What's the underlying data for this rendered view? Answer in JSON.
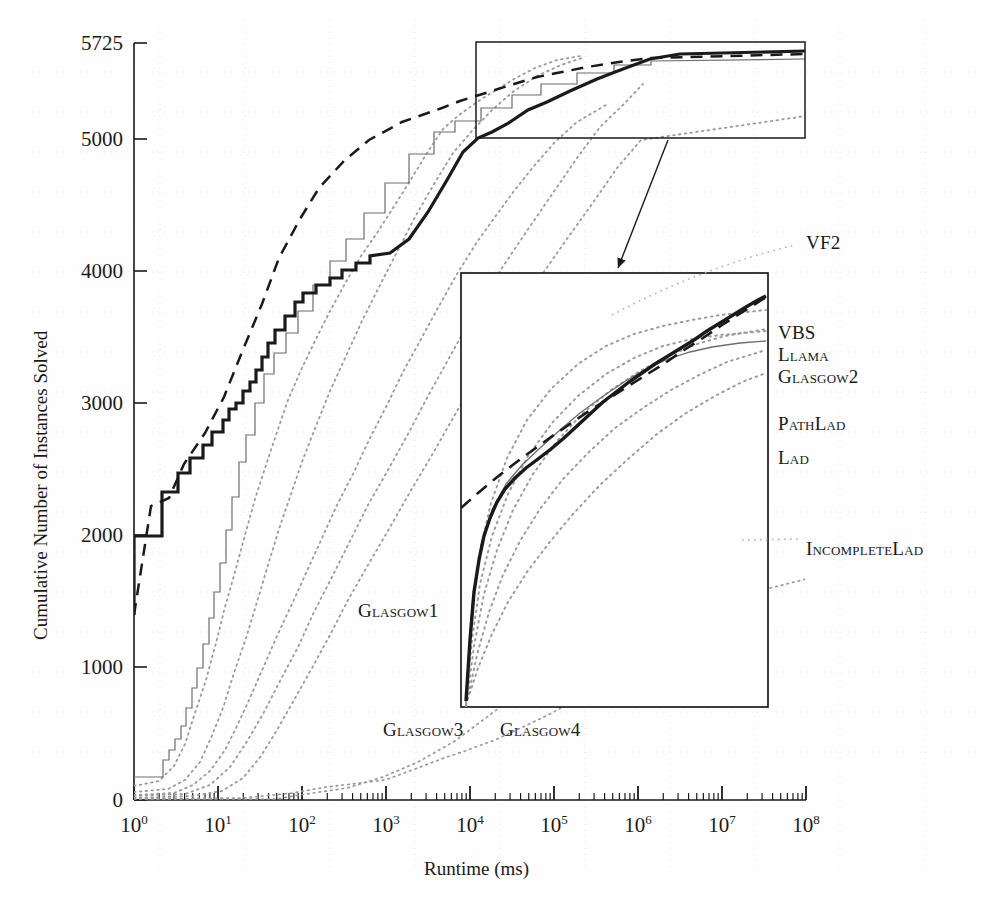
{
  "figure": {
    "background": "#fefefe",
    "ink": "#1a1a1a",
    "faint": "#c8c8c8"
  },
  "axes": {
    "x_title": "Runtime (ms)",
    "y_title": "Cumulative Number of Instances Solved",
    "x_ticks": [
      {
        "mantissa": "10",
        "exp": "0",
        "value": 1
      },
      {
        "mantissa": "10",
        "exp": "1",
        "value": 10
      },
      {
        "mantissa": "10",
        "exp": "2",
        "value": 100
      },
      {
        "mantissa": "10",
        "exp": "3",
        "value": 1000
      },
      {
        "mantissa": "10",
        "exp": "4",
        "value": 10000
      },
      {
        "mantissa": "10",
        "exp": "5",
        "value": 100000
      },
      {
        "mantissa": "10",
        "exp": "6",
        "value": 1000000
      },
      {
        "mantissa": "10",
        "exp": "7",
        "value": 10000000
      },
      {
        "mantissa": "10",
        "exp": "8",
        "value": 100000000
      }
    ],
    "y_ticks": [
      "5725",
      "5000",
      "4000",
      "3000",
      "2000",
      "1000",
      "0"
    ]
  },
  "series_labels": {
    "vf2": "VF2",
    "vbs": "VBS",
    "llama": "Llama",
    "glasgow2": "Glasgow2",
    "pathlad": "PathLad",
    "lad": "Lad",
    "incompletelad": "IncompleteLad",
    "glasgow1": "Glasgow1",
    "glasgow3": "Glasgow3",
    "glasgow4": "Glasgow4"
  },
  "chart_data": {
    "type": "line",
    "title": "",
    "xlabel": "Runtime (ms)",
    "ylabel": "Cumulative Number of Instances Solved",
    "xscale": "log",
    "xlim": [
      1,
      100000000
    ],
    "ylim": [
      0,
      5725
    ],
    "ymax_label": 5725,
    "ytick_values": [
      0,
      1000,
      2000,
      3000,
      4000,
      5000,
      5725
    ],
    "grid": "dotted-faint",
    "legend": "inline-right-annotations",
    "inset": {
      "present": true,
      "source_region_x": [
        10000,
        100000000
      ],
      "source_region_y": [
        5000,
        5725
      ],
      "description": "magnified view of upper-right corner, connected by arrow"
    },
    "series": [
      {
        "name": "VBS",
        "style": "dashed",
        "width": 2.4,
        "points": [
          [
            1,
            1400
          ],
          [
            1.6,
            2340
          ],
          [
            2.6,
            2400
          ],
          [
            4,
            2660
          ],
          [
            7,
            2900
          ],
          [
            12,
            3180
          ],
          [
            20,
            3520
          ],
          [
            35,
            3880
          ],
          [
            60,
            4230
          ],
          [
            110,
            4520
          ],
          [
            200,
            4760
          ],
          [
            400,
            4960
          ],
          [
            800,
            5120
          ],
          [
            2000,
            5260
          ],
          [
            6000,
            5370
          ],
          [
            20000,
            5450
          ],
          [
            80000,
            5520
          ],
          [
            300000,
            5570
          ],
          [
            1000000,
            5620
          ],
          [
            5000000,
            5665
          ],
          [
            20000000,
            5685
          ],
          [
            100000000,
            5700
          ]
        ]
      },
      {
        "name": "Llama",
        "style": "solid-thick",
        "width": 3.2,
        "points": [
          [
            1,
            1400
          ],
          [
            1.05,
            2000
          ],
          [
            2.2,
            2000
          ],
          [
            2.3,
            2330
          ],
          [
            3.2,
            2340
          ],
          [
            3.3,
            2480
          ],
          [
            4.2,
            2500
          ],
          [
            4.4,
            2610
          ],
          [
            5.5,
            2640
          ],
          [
            5.8,
            2730
          ],
          [
            7,
            2760
          ],
          [
            7.5,
            2850
          ],
          [
            9,
            2880
          ],
          [
            10,
            2960
          ],
          [
            12,
            3000
          ],
          [
            14,
            3080
          ],
          [
            17,
            3150
          ],
          [
            20,
            3250
          ],
          [
            25,
            3350
          ],
          [
            30,
            3450
          ],
          [
            40,
            3600
          ],
          [
            55,
            3720
          ],
          [
            70,
            3800
          ],
          [
            100,
            3870
          ],
          [
            150,
            3930
          ],
          [
            220,
            3990
          ],
          [
            320,
            4050
          ],
          [
            500,
            4110
          ],
          [
            800,
            4250
          ],
          [
            1400,
            4450
          ],
          [
            2500,
            4700
          ],
          [
            4500,
            4900
          ],
          [
            8000,
            5010
          ],
          [
            12000,
            5060
          ],
          [
            20000,
            5130
          ],
          [
            40000,
            5230
          ],
          [
            80000,
            5310
          ],
          [
            200000,
            5400
          ],
          [
            600000,
            5490
          ],
          [
            2000000,
            5570
          ],
          [
            8000000,
            5640
          ],
          [
            30000000,
            5680
          ],
          [
            100000000,
            5700
          ]
        ]
      },
      {
        "name": "Glasgow2",
        "style": "solid-thin",
        "width": 1.1,
        "points": [
          [
            1,
            170
          ],
          [
            2.2,
            170
          ],
          [
            2.4,
            300
          ],
          [
            3,
            380
          ],
          [
            3.6,
            460
          ],
          [
            4.2,
            560
          ],
          [
            5,
            700
          ],
          [
            6,
            850
          ],
          [
            7,
            1000
          ],
          [
            8.5,
            1180
          ],
          [
            10,
            1380
          ],
          [
            12,
            1580
          ],
          [
            14,
            1800
          ],
          [
            17,
            2050
          ],
          [
            20,
            2300
          ],
          [
            25,
            2560
          ],
          [
            30,
            2760
          ],
          [
            40,
            3000
          ],
          [
            55,
            3220
          ],
          [
            75,
            3380
          ],
          [
            110,
            3530
          ],
          [
            170,
            3700
          ],
          [
            260,
            3900
          ],
          [
            400,
            4080
          ],
          [
            600,
            4250
          ],
          [
            1000,
            4450
          ],
          [
            1800,
            4680
          ],
          [
            3500,
            4900
          ],
          [
            7000,
            5070
          ],
          [
            12000,
            5150
          ],
          [
            25000,
            5250
          ],
          [
            60000,
            5350
          ],
          [
            150000,
            5430
          ],
          [
            500000,
            5510
          ],
          [
            2000000,
            5590
          ],
          [
            8000000,
            5650
          ],
          [
            30000000,
            5680
          ],
          [
            100000000,
            5695
          ]
        ]
      },
      {
        "name": "Glasgow1",
        "style": "dotted",
        "width": 1.6,
        "points": [
          [
            1,
            100
          ],
          [
            2,
            140
          ],
          [
            3,
            250
          ],
          [
            4,
            420
          ],
          [
            5.5,
            650
          ],
          [
            7,
            900
          ],
          [
            9,
            1180
          ],
          [
            11,
            1450
          ],
          [
            14,
            1720
          ],
          [
            18,
            2000
          ],
          [
            23,
            2280
          ],
          [
            30,
            2530
          ],
          [
            40,
            2780
          ],
          [
            55,
            3020
          ],
          [
            75,
            3230
          ],
          [
            110,
            3430
          ],
          [
            170,
            3650
          ],
          [
            260,
            3860
          ],
          [
            400,
            4050
          ],
          [
            650,
            4230
          ],
          [
            1100,
            4420
          ],
          [
            2000,
            4620
          ],
          [
            4000,
            4840
          ],
          [
            8000,
            5020
          ],
          [
            15000,
            5130
          ],
          [
            35000,
            5230
          ],
          [
            90000,
            5320
          ],
          [
            250000,
            5400
          ],
          [
            900000,
            5480
          ],
          [
            4000000,
            5560
          ],
          [
            20000000,
            5620
          ],
          [
            100000000,
            5660
          ]
        ]
      },
      {
        "name": "Glasgow3",
        "style": "dotted",
        "width": 1.6,
        "points": [
          [
            1,
            60
          ],
          [
            2.5,
            80
          ],
          [
            4,
            150
          ],
          [
            6,
            290
          ],
          [
            8,
            470
          ],
          [
            11,
            700
          ],
          [
            15,
            960
          ],
          [
            20,
            1230
          ],
          [
            27,
            1500
          ],
          [
            36,
            1770
          ],
          [
            48,
            2030
          ],
          [
            65,
            2280
          ],
          [
            90,
            2520
          ],
          [
            130,
            2740
          ],
          [
            200,
            2960
          ],
          [
            320,
            3180
          ],
          [
            520,
            3400
          ],
          [
            850,
            3620
          ],
          [
            1500,
            3830
          ],
          [
            2800,
            4050
          ],
          [
            5500,
            4270
          ],
          [
            11000,
            4460
          ],
          [
            25000,
            4630
          ],
          [
            60000,
            4780
          ],
          [
            160000,
            4920
          ],
          [
            500000,
            5060
          ],
          [
            2000000,
            5200
          ],
          [
            9000000,
            5320
          ],
          [
            40000000,
            5400
          ],
          [
            100000000,
            5440
          ]
        ]
      },
      {
        "name": "Glasgow4",
        "style": "dotted",
        "width": 1.6,
        "points": [
          [
            1,
            40
          ],
          [
            3,
            55
          ],
          [
            5,
            110
          ],
          [
            8,
            220
          ],
          [
            12,
            380
          ],
          [
            17,
            560
          ],
          [
            24,
            770
          ],
          [
            34,
            1000
          ],
          [
            48,
            1240
          ],
          [
            68,
            1490
          ],
          [
            100,
            1740
          ],
          [
            150,
            1990
          ],
          [
            230,
            2240
          ],
          [
            370,
            2490
          ],
          [
            620,
            2740
          ],
          [
            1100,
            2990
          ],
          [
            2000,
            3240
          ],
          [
            3800,
            3490
          ],
          [
            7500,
            3740
          ],
          [
            16000,
            3980
          ],
          [
            38000,
            4210
          ],
          [
            100000,
            4420
          ],
          [
            300000,
            4620
          ],
          [
            1000000,
            4810
          ],
          [
            4000000,
            4990
          ],
          [
            18000000,
            5140
          ],
          [
            100000000,
            5260
          ]
        ]
      },
      {
        "name": "PathLad",
        "style": "dotted",
        "width": 1.6,
        "points": [
          [
            1,
            30
          ],
          [
            4,
            45
          ],
          [
            8,
            110
          ],
          [
            14,
            250
          ],
          [
            22,
            430
          ],
          [
            35,
            650
          ],
          [
            55,
            900
          ],
          [
            85,
            1160
          ],
          [
            130,
            1420
          ],
          [
            210,
            1690
          ],
          [
            340,
            1960
          ],
          [
            560,
            2230
          ],
          [
            950,
            2500
          ],
          [
            1700,
            2780
          ],
          [
            3200,
            3060
          ],
          [
            6200,
            3340
          ],
          [
            13000,
            3620
          ],
          [
            30000,
            3890
          ],
          [
            75000,
            4140
          ],
          [
            200000,
            4380
          ],
          [
            600000,
            4620
          ],
          [
            2000000,
            4860
          ],
          [
            8000000,
            5090
          ],
          [
            30000000,
            5270
          ],
          [
            100000000,
            5420
          ]
        ]
      },
      {
        "name": "Lad",
        "style": "dotted",
        "width": 1.6,
        "points": [
          [
            1,
            20
          ],
          [
            5,
            30
          ],
          [
            11,
            70
          ],
          [
            20,
            170
          ],
          [
            33,
            330
          ],
          [
            52,
            530
          ],
          [
            82,
            760
          ],
          [
            130,
            1000
          ],
          [
            210,
            1250
          ],
          [
            340,
            1510
          ],
          [
            570,
            1780
          ],
          [
            980,
            2050
          ],
          [
            1750,
            2330
          ],
          [
            3300,
            2610
          ],
          [
            6500,
            2900
          ],
          [
            13500,
            3180
          ],
          [
            30000,
            3460
          ],
          [
            72000,
            3730
          ],
          [
            190000,
            3990
          ],
          [
            550000,
            4250
          ],
          [
            1800000,
            4510
          ],
          [
            7000000,
            4780
          ],
          [
            28000000,
            5000
          ],
          [
            100000000,
            5180
          ]
        ]
      },
      {
        "name": "VF2",
        "style": "dotted",
        "width": 1.6,
        "points": [
          [
            1,
            10
          ],
          [
            20,
            20
          ],
          [
            80,
            60
          ],
          [
            200,
            140
          ],
          [
            450,
            250
          ],
          [
            1000,
            400
          ],
          [
            2200,
            580
          ],
          [
            5000,
            790
          ],
          [
            11000,
            1020
          ],
          [
            25000,
            1270
          ],
          [
            60000,
            1530
          ],
          [
            150000,
            1800
          ],
          [
            400000,
            2080
          ],
          [
            1200000,
            2380
          ],
          [
            4000000,
            2700
          ],
          [
            14000000,
            3020
          ],
          [
            50000000,
            3320
          ],
          [
            100000000,
            3480
          ]
        ]
      },
      {
        "name": "IncompleteLad",
        "style": "dotted",
        "width": 1.6,
        "points": [
          [
            1,
            5
          ],
          [
            50,
            10
          ],
          [
            300,
            40
          ],
          [
            900,
            90
          ],
          [
            2500,
            170
          ],
          [
            7000,
            290
          ],
          [
            20000,
            450
          ],
          [
            55000,
            650
          ],
          [
            150000,
            880
          ],
          [
            450000,
            1140
          ],
          [
            1400000,
            1430
          ],
          [
            5000000,
            1760
          ],
          [
            20000000,
            2120
          ],
          [
            60000000,
            2400
          ],
          [
            100000000,
            2550
          ]
        ]
      }
    ]
  }
}
